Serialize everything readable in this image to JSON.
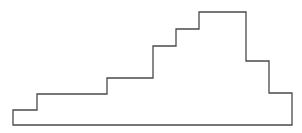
{
  "diagram": {
    "type": "stepped-outline",
    "stroke_color": "#4a4a4a",
    "fill_color": "#ffffff",
    "stroke_width": 1.3,
    "points": [
      [
        13,
        125
      ],
      [
        13,
        110
      ],
      [
        37,
        110
      ],
      [
        37,
        94
      ],
      [
        107,
        94
      ],
      [
        107,
        78
      ],
      [
        153,
        78
      ],
      [
        153,
        46
      ],
      [
        176,
        46
      ],
      [
        176,
        29
      ],
      [
        199,
        29
      ],
      [
        199,
        12
      ],
      [
        246,
        12
      ],
      [
        246,
        61
      ],
      [
        269,
        61
      ],
      [
        269,
        93
      ],
      [
        292,
        93
      ],
      [
        292,
        125
      ]
    ]
  }
}
